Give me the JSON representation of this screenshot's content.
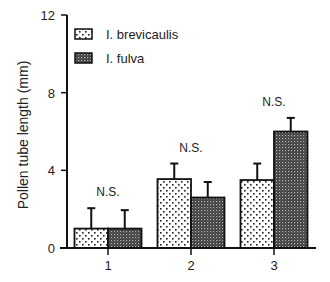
{
  "chart_data": {
    "type": "bar",
    "title": "",
    "xlabel": "",
    "ylabel": "Pollen tube length (mm)",
    "ylim": [
      0,
      12
    ],
    "yticks": [
      0,
      4,
      8,
      12
    ],
    "categories": [
      "1",
      "2",
      "3"
    ],
    "series": [
      {
        "name": "I. brevicaulis",
        "pattern": "sparse-dots",
        "values": [
          1.0,
          3.55,
          3.5
        ],
        "error_upper": [
          2.05,
          4.35,
          4.35
        ]
      },
      {
        "name": "I. fulva",
        "pattern": "dense-checker",
        "values": [
          1.0,
          2.6,
          6.0
        ],
        "error_upper": [
          1.95,
          3.4,
          6.7
        ]
      }
    ],
    "annotations": [
      {
        "category": "1",
        "text": "N.S."
      },
      {
        "category": "2",
        "text": "N.S."
      },
      {
        "category": "3",
        "text": "N.S."
      }
    ],
    "grid": false,
    "legend_position": "upper-left-inside"
  },
  "legend": {
    "items": [
      {
        "label": "I. brevicaulis"
      },
      {
        "label": "I. fulva"
      }
    ]
  },
  "colors": {
    "axis": "#111111",
    "dark_fill": "#555555",
    "light_fill": "#ffffff"
  }
}
